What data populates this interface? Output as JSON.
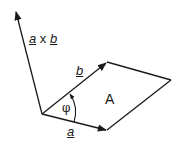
{
  "diagram": {
    "stroke_color": "#1a1a1a",
    "background": "#ffffff",
    "points": {
      "origin": [
        42,
        114
      ],
      "a_tip": [
        107,
        130
      ],
      "b_tip": [
        107,
        62
      ],
      "far_corner": [
        171,
        80
      ],
      "axb_tip": [
        15,
        11
      ]
    },
    "labels": {
      "cross_a": "a",
      "cross_x": " x ",
      "cross_b": "b",
      "vector_a": "a",
      "vector_b": "b",
      "angle": "φ",
      "area": "A"
    }
  }
}
